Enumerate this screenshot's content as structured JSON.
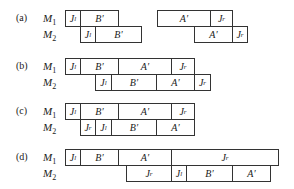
{
  "panels": [
    {
      "label": "(a)",
      "rows": [
        {
          "machine": "M",
          "sub": "1",
          "blocks": [
            {
              "text": "J",
              "sub": "l",
              "x": 65,
              "w": 15
            },
            {
              "text": "B′",
              "sub": "",
              "x": 80,
              "w": 38
            },
            {
              "text": "A′",
              "sub": "",
              "x": 157,
              "w": 53
            },
            {
              "text": "J",
              "sub": "r",
              "x": 210,
              "w": 22
            }
          ]
        },
        {
          "machine": "M",
          "sub": "2",
          "blocks": [
            {
              "text": "J",
              "sub": "l",
              "x": 80,
              "w": 15
            },
            {
              "text": "B′",
              "sub": "",
              "x": 95,
              "w": 46
            },
            {
              "text": "A′",
              "sub": "",
              "x": 194,
              "w": 38
            },
            {
              "text": "J",
              "sub": "r",
              "x": 232,
              "w": 15
            }
          ]
        }
      ]
    },
    {
      "label": "(b)",
      "rows": [
        {
          "machine": "M",
          "sub": "1",
          "blocks": [
            {
              "text": "J",
              "sub": "l",
              "x": 65,
              "w": 15
            },
            {
              "text": "B′",
              "sub": "",
              "x": 80,
              "w": 38
            },
            {
              "text": "A′",
              "sub": "",
              "x": 118,
              "w": 53
            },
            {
              "text": "J",
              "sub": "r",
              "x": 171,
              "w": 23
            }
          ]
        },
        {
          "machine": "M",
          "sub": "2",
          "blocks": [
            {
              "text": "J",
              "sub": "l",
              "x": 95,
              "w": 16
            },
            {
              "text": "B′",
              "sub": "",
              "x": 111,
              "w": 45
            },
            {
              "text": "A′",
              "sub": "",
              "x": 156,
              "w": 38
            },
            {
              "text": "J",
              "sub": "r",
              "x": 194,
              "w": 16
            }
          ]
        }
      ]
    },
    {
      "label": "(c)",
      "rows": [
        {
          "machine": "M",
          "sub": "1",
          "blocks": [
            {
              "text": "J",
              "sub": "l",
              "x": 65,
              "w": 15
            },
            {
              "text": "B′",
              "sub": "",
              "x": 80,
              "w": 38
            },
            {
              "text": "A′",
              "sub": "",
              "x": 118,
              "w": 53
            },
            {
              "text": "J",
              "sub": "r",
              "x": 171,
              "w": 23
            }
          ]
        },
        {
          "machine": "M",
          "sub": "2",
          "blocks": [
            {
              "text": "J",
              "sub": "r",
              "x": 80,
              "w": 15
            },
            {
              "text": "J",
              "sub": "l",
              "x": 95,
              "w": 16
            },
            {
              "text": "B′",
              "sub": "",
              "x": 111,
              "w": 45
            },
            {
              "text": "A′",
              "sub": "",
              "x": 156,
              "w": 38
            }
          ]
        }
      ]
    },
    {
      "label": "(d)",
      "rows": [
        {
          "machine": "M",
          "sub": "1",
          "blocks": [
            {
              "text": "J",
              "sub": "l",
              "x": 65,
              "w": 15
            },
            {
              "text": "B′",
              "sub": "",
              "x": 80,
              "w": 38
            },
            {
              "text": "A′",
              "sub": "",
              "x": 118,
              "w": 53
            },
            {
              "text": "J",
              "sub": "r",
              "x": 171,
              "w": 107
            }
          ]
        },
        {
          "machine": "M",
          "sub": "2",
          "blocks": [
            {
              "text": "J",
              "sub": "r",
              "x": 126,
              "w": 45
            },
            {
              "text": "J",
              "sub": "l",
              "x": 171,
              "w": 15
            },
            {
              "text": "B′",
              "sub": "",
              "x": 186,
              "w": 46
            },
            {
              "text": "A′",
              "sub": "",
              "x": 232,
              "w": 38
            }
          ]
        }
      ]
    }
  ],
  "layout": {
    "panel_tops": [
      10,
      58,
      103,
      149
    ],
    "row_height": 16
  }
}
